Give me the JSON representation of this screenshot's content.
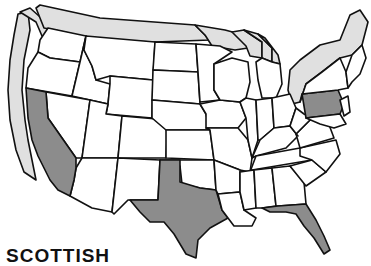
{
  "map": {
    "title": "United States",
    "colors": {
      "highlight": "#8c8c8c",
      "border_band": "#e0e0e0",
      "state_fill": "#ffffff",
      "outline": "#111111",
      "background": "#ffffff"
    },
    "highlighted_states": [
      "California",
      "Texas",
      "Florida",
      "Pennsylvania"
    ],
    "border_bands": [
      "Pacific coast",
      "Canadian border",
      "Great Lakes",
      "Northeast / St. Lawrence"
    ]
  },
  "caption": {
    "text": "SCOTTISH"
  }
}
